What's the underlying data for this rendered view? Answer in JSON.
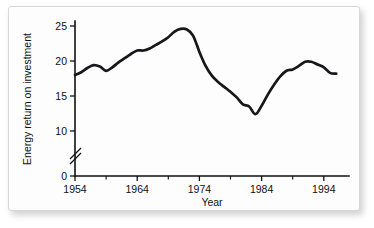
{
  "chart_data": {
    "type": "line",
    "title": "",
    "xlabel": "Year",
    "ylabel": "Energy return on investment",
    "xlim": [
      1954,
      1996
    ],
    "ylim": [
      0,
      25
    ],
    "y_axis_break": true,
    "y_axis_break_between": [
      0,
      10
    ],
    "grid": false,
    "legend": null,
    "xticks": [
      1954,
      1964,
      1974,
      1984,
      1994
    ],
    "xtick_labels": [
      "1954",
      "1964",
      "1974",
      "1984",
      "1994"
    ],
    "xminor_ticks": [
      1959,
      1969,
      1979,
      1989
    ],
    "yticks": [
      0,
      10,
      15,
      20,
      25
    ],
    "ytick_labels": [
      "0",
      "10",
      "15",
      "20",
      "25"
    ],
    "x": [
      1954,
      1955,
      1956,
      1957,
      1958,
      1959,
      1960,
      1961,
      1962,
      1963,
      1964,
      1965,
      1966,
      1967,
      1968,
      1969,
      1970,
      1971,
      1972,
      1973,
      1974,
      1975,
      1976,
      1977,
      1978,
      1979,
      1980,
      1981,
      1982,
      1983,
      1984,
      1985,
      1986,
      1987,
      1988,
      1989,
      1990,
      1991,
      1992,
      1993,
      1994,
      1995,
      1996
    ],
    "values": [
      18.0,
      18.4,
      19.0,
      19.4,
      19.2,
      18.6,
      19.1,
      19.8,
      20.4,
      21.0,
      21.5,
      21.5,
      21.8,
      22.3,
      22.8,
      23.4,
      24.2,
      24.6,
      24.5,
      23.6,
      21.3,
      19.3,
      17.9,
      17.0,
      16.3,
      15.6,
      14.8,
      13.8,
      13.5,
      12.4,
      13.6,
      15.2,
      16.6,
      17.8,
      18.6,
      18.8,
      19.3,
      19.9,
      19.9,
      19.5,
      19.1,
      18.3,
      18.2
    ],
    "series_name": "Energy return on investment"
  }
}
